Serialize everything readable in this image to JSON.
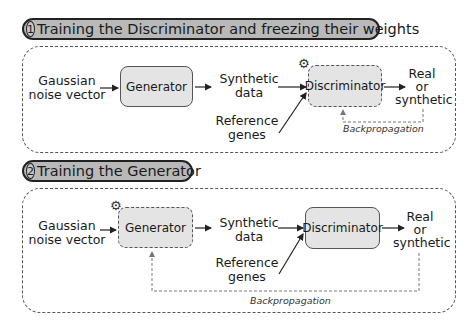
{
  "panels": [
    {
      "step": "1",
      "title": "Training the Discriminator and freezing their weights",
      "input": "Gaussian noise vector",
      "input_lines": [
        "Gaussian",
        "noise vector"
      ],
      "generator": "Generator",
      "synthetic": [
        "Synthetic",
        "data"
      ],
      "reference": [
        "Reference",
        "genes"
      ],
      "discriminator": "Discriminator",
      "output": [
        "Real",
        "or",
        "synthetic"
      ],
      "backprop": "Backpropagation",
      "trained_component": "discriminator",
      "gear_icon": "gear-icon"
    },
    {
      "step": "2",
      "title": "Training the Generator",
      "input": "Gaussian noise vector",
      "input_lines": [
        "Gaussian",
        "noise vector"
      ],
      "generator": "Generator",
      "synthetic": [
        "Synthetic",
        "data"
      ],
      "reference": [
        "Reference",
        "genes"
      ],
      "discriminator": "Discriminator",
      "output": [
        "Real",
        "or",
        "synthetic"
      ],
      "backprop": "Backpropagation",
      "trained_component": "generator",
      "gear_icon": "gear-icon"
    }
  ],
  "colors": {
    "pill_fill": "#b9b9b9",
    "box_fill": "#e4e4e4",
    "stroke": "#555555"
  }
}
